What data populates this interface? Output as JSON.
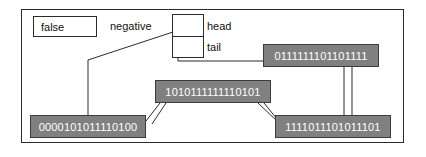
{
  "diagram": {
    "frame": {
      "name": "diagram-frame"
    },
    "boolean_cell": {
      "value": "false"
    },
    "labels": {
      "negative": "negative",
      "head": "head",
      "tail": "tail"
    },
    "pair_box": {
      "head_slot": "",
      "tail_slot": ""
    },
    "nodes": [
      {
        "id": "top-right",
        "value": "0111111101101111"
      },
      {
        "id": "middle",
        "value": "1010111111110101"
      },
      {
        "id": "bottom-left",
        "value": "0000101011110100"
      },
      {
        "id": "bottom-right",
        "value": "1111011101011101"
      }
    ],
    "colors": {
      "node_fill": "#808080",
      "node_border": "#3c3c3c",
      "node_text": "#ffffff",
      "line": "#2b2b2b",
      "background": "#ffffff"
    }
  }
}
